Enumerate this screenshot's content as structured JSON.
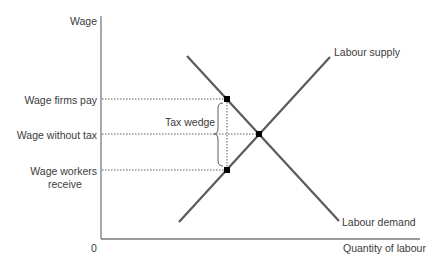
{
  "axes": {
    "y_label": "Wage",
    "x_label": "Quantity of labour",
    "origin_label": "0"
  },
  "levels": {
    "wage_firms_pay": "Wage firms pay",
    "wage_without_tax": "Wage without tax",
    "wage_workers_receive_line1": "Wage workers",
    "wage_workers_receive_line2": "receive"
  },
  "curves": {
    "supply_label": "Labour supply",
    "demand_label": "Labour demand"
  },
  "annotation": {
    "tax_wedge": "Tax wedge"
  },
  "colors": {
    "axis": "#7a7a7a",
    "curve": "#5a5a5a",
    "dotted": "#4a4a4a",
    "point": "#000000",
    "text": "#3b3b3b"
  }
}
